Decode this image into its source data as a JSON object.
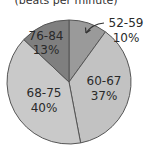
{
  "chart_data": {
    "type": "pie",
    "title": "(beats per minute)",
    "categories": [
      "52-59",
      "60-67",
      "68-75",
      "76-84"
    ],
    "values": [
      10,
      37,
      40,
      13
    ],
    "labels": [
      "10%",
      "37%",
      "40%",
      "13%"
    ],
    "colors": [
      "#9a9a9a",
      "#c2c2c2",
      "#c9c9c9",
      "#7f7f7f"
    ],
    "start_angle_deg": 0,
    "direction": "clockwise",
    "annotations": [
      {
        "text": "52-59",
        "arrow_to": "52-59 slice"
      }
    ]
  },
  "labels": {
    "title": "(beats per minute)",
    "s0_name": "52-59",
    "s0_pct": "10%",
    "s1_name": "60-67",
    "s1_pct": "37%",
    "s2_name": "68-75",
    "s2_pct": "40%",
    "s3_name": "76-84",
    "s3_pct": "13%"
  }
}
